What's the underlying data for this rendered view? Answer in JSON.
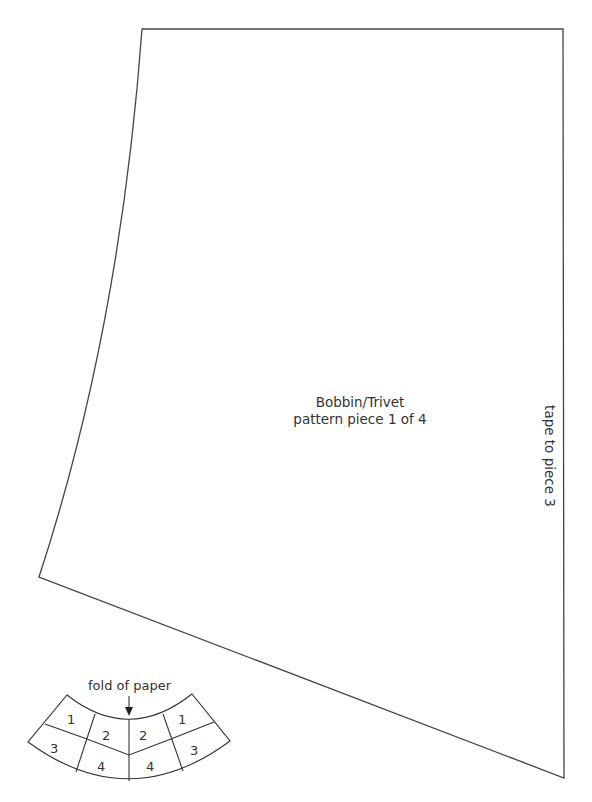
{
  "pattern": {
    "title": "Bobbin/Trivet",
    "subtitle": "pattern piece 1 of 4",
    "side_note": "tape to piece 3",
    "line_color": "#444444"
  },
  "diagram": {
    "fold_label": "fold of paper",
    "cells": {
      "left_top": "1",
      "left_mid_top": "2",
      "right_mid_top": "2",
      "right_top": "1",
      "left_bottom": "3",
      "left_mid_bottom": "4",
      "right_mid_bottom": "4",
      "right_bottom": "3"
    }
  }
}
